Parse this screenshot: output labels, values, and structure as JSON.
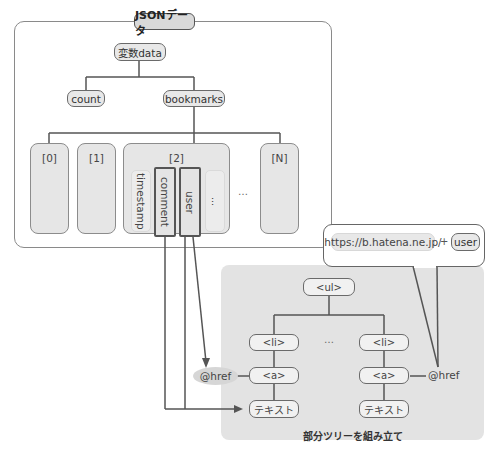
{
  "json_section": {
    "title": "JSONデータ",
    "root": "変数data",
    "children": [
      "count",
      "bookmarks"
    ],
    "array_items": [
      "[0]",
      "[1]",
      "[2]",
      "[N]"
    ],
    "ellipsis": "…",
    "item2_fields": [
      "timestamp",
      "comment",
      "user",
      "…"
    ]
  },
  "callout": {
    "url": "https://b.hatena.ne.jp/",
    "plus": "+",
    "user": "user"
  },
  "tree_section": {
    "root": "<ul>",
    "li_left": "<li>",
    "li_right": "<li>",
    "ellipsis": "…",
    "a_left": "<a>",
    "a_right": "<a>",
    "text_left": "テキスト",
    "text_right": "テキスト",
    "href_left": "@href",
    "href_right": "@href",
    "caption": "部分ツリーを組み立て"
  },
  "colors": {
    "line": "#555555",
    "node_fill": "#e8e8e8",
    "panel_fill": "#e3e3e3",
    "highlight_border": "#555555"
  }
}
